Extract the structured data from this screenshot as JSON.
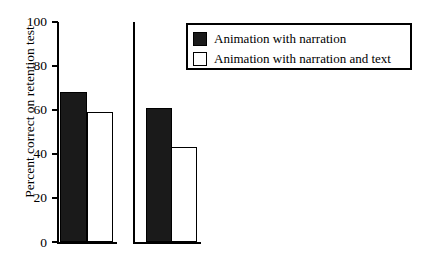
{
  "chart_data": {
    "type": "bar",
    "title": "",
    "xlabel": "",
    "ylabel": "Percent correct on retention test",
    "ylim": [
      0,
      100
    ],
    "yticks": [
      0,
      20,
      40,
      60,
      80,
      100
    ],
    "ytick_labels": [
      "0",
      "20",
      "40",
      "60",
      "80",
      "100"
    ],
    "grid": false,
    "legend_position": "top-right",
    "categories": [
      "Experiment 1",
      "Experiment 2"
    ],
    "series": [
      {
        "name": "Animation with narration",
        "style": "filled-black",
        "color": "#1a1a1a",
        "values": [
          68,
          61
        ]
      },
      {
        "name": "Animation with narration and text",
        "style": "hollow-white",
        "color": "#ffffff",
        "values": [
          59,
          43
        ]
      }
    ]
  },
  "legend": {
    "items": [
      {
        "label": "Animation with narration",
        "swatch": "filled"
      },
      {
        "label": "Animation with narration and text",
        "swatch": "hollow"
      }
    ]
  },
  "axis": {
    "y_label": "Percent correct on retention test",
    "tick_100": "100",
    "tick_80": "80",
    "tick_60": "60",
    "tick_40": "40",
    "tick_20": "20",
    "tick_0": "0"
  },
  "colors": {
    "bar_filled": "#1a1a1a",
    "bar_hollow": "#ffffff",
    "ink": "#000000",
    "background": "#ffffff"
  }
}
